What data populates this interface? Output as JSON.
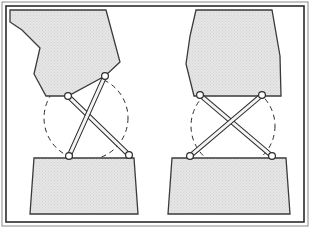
{
  "figure": {
    "title": "Scissor linkage mechanism in two configurations",
    "caption": "",
    "width": 310,
    "height": 228,
    "background_color": "#ffffff"
  },
  "frame": {
    "outer_border_color": "#8a8a8a",
    "inner_border_color": "#2b2b2b",
    "outer_rect": {
      "x": 2,
      "y": 2,
      "width": 306,
      "height": 224
    },
    "inner_rect": {
      "x": 6,
      "y": 6,
      "width": 298,
      "height": 216
    },
    "outer_stroke_width": 1,
    "inner_stroke_width": 1.6
  },
  "style": {
    "body_fill": "#e2e2e2",
    "body_stroke": "#3a3a3a",
    "base_fill": "#e4e4e4",
    "base_stroke": "#3a3a3a",
    "link_fill": "#f4f4f4",
    "link_stroke": "#2b2b2b",
    "joint_fill": "#ffffff",
    "joint_stroke": "#2b2b2b",
    "dashed_circle_stroke": "#2b2b2b",
    "dash_pattern": "5,4",
    "joint_radius": 3.4,
    "link_half_width": 2.0
  },
  "panels": [
    {
      "id": "left",
      "name": "tilted-configuration",
      "label": "",
      "upper_body": {
        "name": "upper-body-tilted",
        "points": "10,10 106,10 120,62 105,76 68,96 46,96 34,74 40,48 22,30 10,22"
      },
      "base_block": {
        "name": "base-block-left",
        "points": "34,158 134,158 138,214 30,214"
      },
      "dashed_circle": {
        "name": "reference-circle-left",
        "cx": 86,
        "cy": 118,
        "r": 42,
        "rotation": 0
      },
      "joints": [
        {
          "name": "joint-upper-left",
          "x": 68,
          "y": 96,
          "r": 3.4
        },
        {
          "name": "joint-upper-right",
          "x": 105,
          "y": 76,
          "r": 3.4
        },
        {
          "name": "joint-lower-left",
          "x": 69,
          "y": 156,
          "r": 3.4
        },
        {
          "name": "joint-lower-right",
          "x": 129,
          "y": 155,
          "r": 3.4
        }
      ],
      "links": [
        {
          "name": "link-a-left",
          "x1": 68,
          "y1": 96,
          "x2": 129,
          "y2": 155
        },
        {
          "name": "link-b-left",
          "x1": 105,
          "y1": 76,
          "x2": 69,
          "y2": 156
        }
      ]
    },
    {
      "id": "right",
      "name": "upright-configuration",
      "label": "",
      "upper_body": {
        "name": "upper-body-upright",
        "points": "196,10 272,10 280,56 281,96 244,96 194,96 186,64 190,36"
      },
      "base_block": {
        "name": "base-block-right",
        "points": "172,158 286,158 290,214 168,214"
      },
      "dashed_circle": {
        "name": "reference-circle-right",
        "cx": 233,
        "cy": 126,
        "r": 42,
        "rotation": 0
      },
      "joints": [
        {
          "name": "joint-upper-left",
          "x": 200,
          "y": 95,
          "r": 3.4
        },
        {
          "name": "joint-upper-right",
          "x": 262,
          "y": 95,
          "r": 3.4
        },
        {
          "name": "joint-lower-left",
          "x": 190,
          "y": 156,
          "r": 3.4
        },
        {
          "name": "joint-lower-right",
          "x": 272,
          "y": 156,
          "r": 3.4
        }
      ],
      "links": [
        {
          "name": "link-a-right",
          "x1": 200,
          "y1": 95,
          "x2": 272,
          "y2": 156
        },
        {
          "name": "link-b-right",
          "x1": 262,
          "y1": 95,
          "x2": 190,
          "y2": 156
        }
      ]
    }
  ]
}
